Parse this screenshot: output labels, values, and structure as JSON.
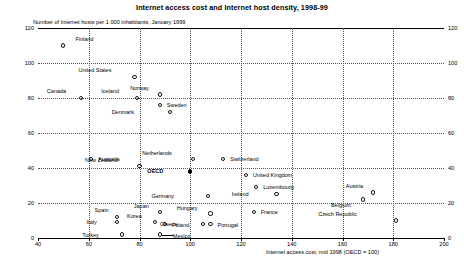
{
  "title": "Internet access cost and Internet host density, 1998-99",
  "ylabel": "Number of Internet hosts per 1 000 inhabitants, January 1999",
  "xlabel": "Internet access cost, mid 1998 (OECD = 100)",
  "colors": {
    "marker": "#1a1a1a",
    "highlight": "#000000",
    "grid": "#555555",
    "axis": "#000000"
  },
  "chart_data": {
    "type": "scatter",
    "title": "Internet access cost and Internet host density, 1998-99",
    "xlabel": "Internet access cost, mid 1998 (OECD = 100)",
    "ylabel": "Number of Internet hosts per 1 000 inhabitants, January 1999",
    "xlim": [
      40,
      200
    ],
    "ylim": [
      0,
      120
    ],
    "xticks": [
      40,
      60,
      80,
      100,
      120,
      140,
      160,
      180,
      200
    ],
    "yticks": [
      0,
      20,
      40,
      60,
      80,
      100,
      120
    ],
    "grid": true,
    "legend": "none",
    "points": [
      {
        "label": "Finland",
        "x": 50,
        "y": 110,
        "lx": 12,
        "ly": -10,
        "marker": "open"
      },
      {
        "label": "United States",
        "x": 78,
        "y": 92,
        "lx": -23,
        "ly": -10,
        "marker": "open"
      },
      {
        "label": "Canada",
        "x": 57,
        "y": 80,
        "lx": -15,
        "ly": -10,
        "marker": "open"
      },
      {
        "label": "Iceland",
        "x": 79,
        "y": 80,
        "lx": -18,
        "ly": -10,
        "marker": "open"
      },
      {
        "label": "Norway",
        "x": 88,
        "y": 82,
        "lx": -11,
        "ly": -10,
        "marker": "open"
      },
      {
        "label": "Sweden",
        "x": 88,
        "y": 76,
        "lx": 7,
        "ly": -3,
        "marker": "open"
      },
      {
        "label": "Denmark",
        "x": 92,
        "y": 72,
        "lx": -36,
        "ly": -3,
        "marker": "open"
      },
      {
        "label": "Australia",
        "x": 61,
        "y": 45,
        "lx": 7,
        "ly": -3,
        "marker": "open"
      },
      {
        "label": "New Zealand",
        "x": 80,
        "y": 41,
        "lx": -22,
        "ly": -9,
        "marker": "open"
      },
      {
        "label": "Netherlands",
        "x": 101,
        "y": 45,
        "lx": -21,
        "ly": -9,
        "marker": "open"
      },
      {
        "label": "Switzerland",
        "x": 113,
        "y": 45,
        "lx": 7,
        "ly": -3,
        "marker": "open"
      },
      {
        "label": "OECD",
        "x": 100,
        "y": 38,
        "lx": -27,
        "ly": -4,
        "marker": "filled"
      },
      {
        "label": "United Kingdom",
        "x": 122,
        "y": 36,
        "lx": 7,
        "ly": -3,
        "marker": "open"
      },
      {
        "label": "Luxembourg",
        "x": 126,
        "y": 29,
        "lx": 7,
        "ly": -3,
        "marker": "open"
      },
      {
        "label": "Ireland",
        "x": 134,
        "y": 25,
        "lx": -28,
        "ly": -3,
        "marker": "open"
      },
      {
        "label": "Germany",
        "x": 107,
        "y": 24,
        "lx": -34,
        "ly": -3,
        "marker": "open"
      },
      {
        "label": "Austria",
        "x": 172,
        "y": 26,
        "lx": -10,
        "ly": -10,
        "marker": "open"
      },
      {
        "label": "Belgium",
        "x": 168,
        "y": 22,
        "lx": -12,
        "ly": 2,
        "marker": "open"
      },
      {
        "label": "France",
        "x": 125,
        "y": 15,
        "lx": 7,
        "ly": -3,
        "marker": "open"
      },
      {
        "label": "Czech Republic",
        "x": 181,
        "y": 10,
        "lx": -39,
        "ly": -10,
        "marker": "open"
      },
      {
        "label": "Hungary",
        "x": 108,
        "y": 14,
        "lx": -13,
        "ly": -9,
        "marker": "open"
      },
      {
        "label": "Portugal",
        "x": 108,
        "y": 8,
        "lx": 7,
        "ly": -2,
        "marker": "open"
      },
      {
        "label": "Spain",
        "x": 71,
        "y": 12,
        "lx": -8,
        "ly": -10,
        "marker": "open"
      },
      {
        "label": "Italy",
        "x": 71,
        "y": 9,
        "lx": -20,
        "ly": -3,
        "marker": "open"
      },
      {
        "label": "Japan",
        "x": 88,
        "y": 15,
        "lx": -11,
        "ly": -9,
        "marker": "open"
      },
      {
        "label": "Korea",
        "x": 86,
        "y": 9,
        "lx": -13,
        "ly": -9,
        "marker": "open"
      },
      {
        "label": "Poland",
        "x": 90,
        "y": 8,
        "lx": 7,
        "ly": -2,
        "marker": "open"
      },
      {
        "label": "Greece",
        "x": 105,
        "y": 8,
        "lx": -25,
        "ly": -3,
        "marker": "open"
      },
      {
        "label": "Turkey",
        "x": 73,
        "y": 2,
        "lx": -23,
        "ly": -3,
        "marker": "open"
      },
      {
        "label": "Mexico",
        "x": 88,
        "y": 2,
        "lx": 13,
        "ly": -2,
        "marker": "open"
      }
    ]
  }
}
